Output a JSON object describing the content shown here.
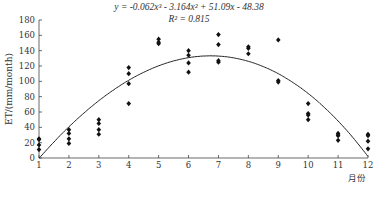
{
  "chart_data": {
    "type": "scatter",
    "title": "",
    "equation": "y = -0.062x³ - 3.164x² + 51.09x - 48.38",
    "r2": "R² = 0.815",
    "xlabel": "月份",
    "ylabel": "ET/(mm/month)",
    "xlim": [
      1,
      12
    ],
    "ylim": [
      0,
      180
    ],
    "xticks": [
      1,
      2,
      3,
      4,
      5,
      6,
      7,
      8,
      9,
      10,
      11,
      12
    ],
    "yticks": [
      0,
      20,
      40,
      60,
      80,
      100,
      120,
      140,
      160,
      180
    ],
    "series": [
      {
        "name": "observed",
        "points": [
          [
            1,
            25
          ],
          [
            1,
            24
          ],
          [
            1,
            17
          ],
          [
            1,
            11
          ],
          [
            2,
            37
          ],
          [
            2,
            32
          ],
          [
            2,
            25
          ],
          [
            2,
            19
          ],
          [
            3,
            50
          ],
          [
            3,
            45
          ],
          [
            3,
            37
          ],
          [
            3,
            31
          ],
          [
            4,
            118
          ],
          [
            4,
            110
          ],
          [
            4,
            97
          ],
          [
            4,
            71
          ],
          [
            5,
            155
          ],
          [
            5,
            151
          ],
          [
            5,
            149
          ],
          [
            6,
            140
          ],
          [
            6,
            134
          ],
          [
            6,
            124
          ],
          [
            6,
            112
          ],
          [
            7,
            161
          ],
          [
            7,
            148
          ],
          [
            7,
            127
          ],
          [
            7,
            125
          ],
          [
            8,
            145
          ],
          [
            8,
            143
          ],
          [
            8,
            136
          ],
          [
            9,
            154
          ],
          [
            9,
            101
          ],
          [
            9,
            99
          ],
          [
            10,
            71
          ],
          [
            10,
            58
          ],
          [
            10,
            56
          ],
          [
            10,
            50
          ],
          [
            11,
            32
          ],
          [
            11,
            30
          ],
          [
            11,
            29
          ],
          [
            11,
            23
          ],
          [
            12,
            31
          ],
          [
            12,
            29
          ],
          [
            12,
            22
          ],
          [
            12,
            12
          ]
        ]
      }
    ],
    "fit": {
      "type": "cubic",
      "coefficients": [
        -0.062,
        -3.164,
        51.09,
        -48.38
      ]
    },
    "grid": false,
    "legend": "none"
  }
}
